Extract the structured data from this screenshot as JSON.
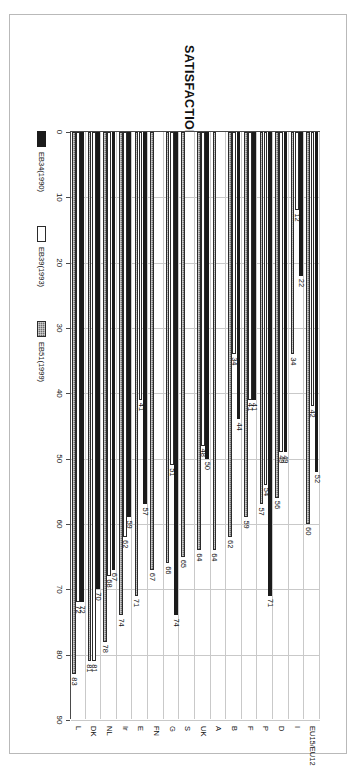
{
  "chart_data": {
    "type": "bar",
    "orientation": "horizontal",
    "title": "SATISFACTION WITH NATIONAL DEMOCRACY",
    "xlabel": "",
    "ylabel": "",
    "xlim": [
      0,
      90
    ],
    "ticks": [
      0,
      10,
      20,
      30,
      40,
      50,
      60,
      70,
      80,
      90
    ],
    "grid": true,
    "legend_position": "bottom-left",
    "categories": [
      "L",
      "DK",
      "NL",
      "Ir",
      "E",
      "FN",
      "G",
      "S",
      "UK",
      "A",
      "B",
      "F",
      "P",
      "D",
      "I",
      "EU15/EU12"
    ],
    "series": [
      {
        "name": "EB34(1990)",
        "color": "#1b1b1b",
        "style": "solid-black",
        "values": [
          72,
          70,
          67,
          59,
          57,
          null,
          74,
          null,
          50,
          null,
          44,
          41,
          71,
          49,
          22,
          52
        ]
      },
      {
        "name": "EB39(1993)",
        "color": "#ffffff",
        "style": "white",
        "values": [
          72,
          81,
          68,
          62,
          41,
          null,
          51,
          null,
          48,
          null,
          34,
          41,
          54,
          49,
          12,
          42
        ]
      },
      {
        "name": "EB51(1999)",
        "color": "#6e6e6e",
        "style": "hatched-gray",
        "values": [
          83,
          81,
          78,
          74,
          71,
          67,
          66,
          65,
          64,
          64,
          62,
          59,
          57,
          56,
          34,
          60
        ]
      }
    ]
  },
  "legend": {
    "items": [
      {
        "label": "EB34(1990)",
        "swatch": "eb34"
      },
      {
        "label": "EB39(1993)",
        "swatch": "eb39"
      },
      {
        "label": "EB51(1999)",
        "swatch": "eb51"
      }
    ]
  }
}
